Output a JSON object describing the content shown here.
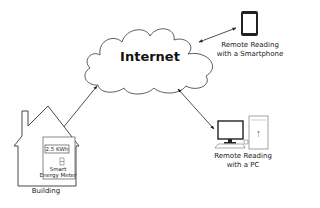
{
  "cloud": {
    "label": "Internet"
  },
  "smartphone": {
    "label_line1": "Remote Reading",
    "label_line2": "with a Smartphone"
  },
  "pc": {
    "label_line1": "Remote Reading",
    "label_line2": "with a PC"
  },
  "building": {
    "label": "Building",
    "meter": {
      "display": "2.5 KWh",
      "label_line1": "Smart",
      "label_line2": "Energy Meter"
    }
  },
  "connections": [
    {
      "from": "Internet",
      "to": "Smartphone",
      "type": "bidirectional-arrow"
    },
    {
      "from": "Internet",
      "to": "Building",
      "type": "bidirectional-arrow"
    },
    {
      "from": "Internet",
      "to": "PC",
      "type": "bidirectional-arrow"
    }
  ],
  "colors": {
    "line": "#222222",
    "background": "#ffffff"
  }
}
